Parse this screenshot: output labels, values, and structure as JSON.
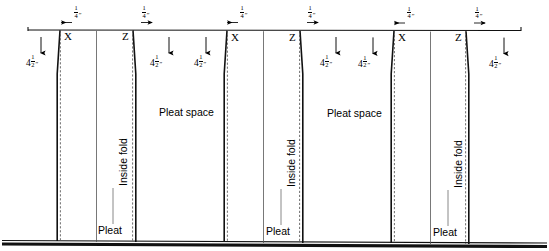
{
  "diagram": {
    "colors": {
      "ink": "#000000",
      "paper": "#ffffff",
      "leader": "#6b6b6b"
    },
    "units": {
      "quarter_inch": "1/4\"",
      "pleat_depth": "4 1/2\""
    },
    "dimension_fraction_top": {
      "numerator": "1",
      "denominator": "4",
      "inch_mark": "\""
    },
    "pleat_depth_label": {
      "whole": "4",
      "numerator": "1",
      "denominator": "2",
      "inch_mark": "\""
    },
    "marker_x": "X",
    "marker_z": "Z",
    "labels": {
      "inside_fold": "Inside fold",
      "pleat_space": "Pleat space",
      "pleat": "Pleat"
    },
    "top_dimensions": [
      {
        "id": "dim-1",
        "value": "1/4\"",
        "x": 77,
        "arrow": "left"
      },
      {
        "id": "dim-2",
        "value": "1/4\"",
        "x": 146,
        "arrow": "right"
      },
      {
        "id": "dim-3",
        "value": "1/4\"",
        "x": 242,
        "arrow": "left"
      },
      {
        "id": "dim-4",
        "value": "1/4\"",
        "x": 312,
        "arrow": "right"
      },
      {
        "id": "dim-5",
        "value": "1/4\"",
        "x": 411,
        "arrow": "left"
      },
      {
        "id": "dim-6",
        "value": "1/4\"",
        "x": 479,
        "arrow": "right"
      }
    ],
    "depth_labels": [
      {
        "id": "depth-1",
        "value": "4 1/2\"",
        "x": 30,
        "y": 62
      },
      {
        "id": "depth-2",
        "value": "4 1/2\"",
        "x": 152,
        "y": 62
      },
      {
        "id": "depth-3",
        "value": "4 1/2\"",
        "x": 198,
        "y": 62
      },
      {
        "id": "depth-4",
        "value": "4 1/2\"",
        "x": 326,
        "y": 62
      },
      {
        "id": "depth-5",
        "value": "4 1/2\"",
        "x": 374,
        "y": 62
      },
      {
        "id": "depth-6",
        "value": "4 1/2\"",
        "x": 497,
        "y": 62
      }
    ],
    "markers": [
      {
        "id": "marker-x-1",
        "letter": "X",
        "x": 64,
        "y": 32
      },
      {
        "id": "marker-z-1",
        "letter": "Z",
        "x": 128,
        "y": 32
      },
      {
        "id": "marker-x-2",
        "letter": "X",
        "x": 229,
        "y": 32
      },
      {
        "id": "marker-z-2",
        "letter": "Z",
        "x": 295,
        "y": 32
      },
      {
        "id": "marker-x-3",
        "letter": "X",
        "x": 398,
        "y": 32
      },
      {
        "id": "marker-z-3",
        "letter": "Z",
        "x": 461,
        "y": 32
      }
    ],
    "inside_fold_labels": [
      {
        "id": "inside-fold-1",
        "x": 117,
        "y": 185
      },
      {
        "id": "inside-fold-2",
        "x": 284,
        "y": 185
      },
      {
        "id": "inside-fold-3",
        "x": 451,
        "y": 185
      }
    ],
    "pleat_space_labels": [
      {
        "id": "pleat-space-1",
        "x": 161,
        "y": 112
      },
      {
        "id": "pleat-space-2",
        "x": 329,
        "y": 112
      }
    ],
    "pleat_labels": [
      {
        "id": "pleat-1",
        "x": 100,
        "y": 232
      },
      {
        "id": "pleat-2",
        "x": 268,
        "y": 232
      },
      {
        "id": "pleat-3",
        "x": 435,
        "y": 232
      }
    ]
  }
}
